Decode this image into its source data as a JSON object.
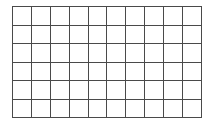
{
  "figure": {
    "kind": "blank-grid",
    "columns": 10,
    "rows": 6,
    "total_cells": 60,
    "cell_text": "",
    "colors": {
      "line": "#4a4a4a",
      "border": "#3f3f3f",
      "cell_fill": "#ffffff",
      "page_background": "#ffffff"
    },
    "geometry": {
      "left_px": 12,
      "top_px": 6,
      "width_px": 190,
      "height_px": 112,
      "cell_width_px": 19,
      "cell_height_px": 18.7,
      "line_width_px": 1
    }
  }
}
